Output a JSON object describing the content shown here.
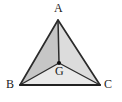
{
  "figure": {
    "kind": "geometry-diagram",
    "background_color": "#ffffff",
    "outline_color": "#2b2b2b",
    "labels": {
      "apex": "A",
      "bottom_left": "B",
      "bottom_right": "C",
      "centroid": "G"
    },
    "points": {
      "A": {
        "x": 58,
        "y": 20
      },
      "B": {
        "x": 20,
        "y": 85
      },
      "C": {
        "x": 100,
        "y": 85
      },
      "G": {
        "x": 59,
        "y": 63
      }
    },
    "regions": [
      {
        "name": "triangle-ABG",
        "vertices": "A,B,G",
        "fill": "#c6c6c6"
      },
      {
        "name": "triangle-AGC",
        "vertices": "A,G,C",
        "fill": "#dcdcdc"
      },
      {
        "name": "triangle-BGC",
        "vertices": "B,G,C",
        "fill": "#e9e9e9"
      }
    ],
    "segments": [
      {
        "name": "side-AB",
        "from": "A",
        "to": "B"
      },
      {
        "name": "side-BC",
        "from": "B",
        "to": "C"
      },
      {
        "name": "side-CA",
        "from": "C",
        "to": "A"
      },
      {
        "name": "cevian-AG",
        "from": "A",
        "to": "G"
      },
      {
        "name": "cevian-BG",
        "from": "B",
        "to": "G"
      },
      {
        "name": "cevian-CG",
        "from": "C",
        "to": "G"
      }
    ],
    "centroid_dot": {
      "x": 59,
      "y": 63,
      "radius": 2.1,
      "color": "#111111"
    }
  }
}
